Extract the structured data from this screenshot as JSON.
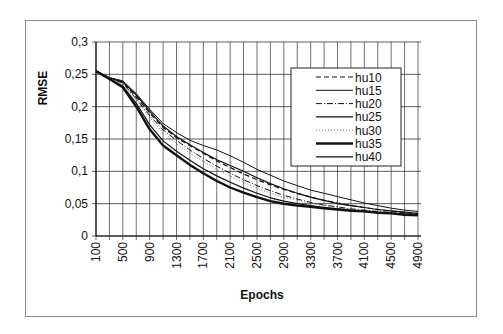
{
  "chart_data": {
    "type": "line",
    "title": "",
    "xlabel": "Epochs",
    "ylabel": "RMSE",
    "ylim": [
      0,
      0.3
    ],
    "xlim": [
      100,
      4900
    ],
    "grid": true,
    "legend_position": "upper right (inside plot)",
    "y_ticks": [
      "0",
      "0,05",
      "0,1",
      "0,15",
      "0,2",
      "0,25",
      "0,3"
    ],
    "x_ticks": [
      "100",
      "500",
      "900",
      "1300",
      "1700",
      "2100",
      "2500",
      "2900",
      "3300",
      "3700",
      "4100",
      "4500",
      "4900"
    ],
    "x": [
      100,
      300,
      500,
      700,
      900,
      1100,
      1300,
      1500,
      1700,
      1900,
      2100,
      2300,
      2500,
      2700,
      2900,
      3100,
      3300,
      3500,
      3700,
      3900,
      4100,
      4300,
      4500,
      4700,
      4900
    ],
    "series": [
      {
        "name": "hu10",
        "style": "dashed",
        "values": [
          0.255,
          0.245,
          0.238,
          0.215,
          0.19,
          0.168,
          0.152,
          0.14,
          0.128,
          0.116,
          0.106,
          0.096,
          0.087,
          0.079,
          0.072,
          0.066,
          0.06,
          0.055,
          0.051,
          0.047,
          0.044,
          0.041,
          0.038,
          0.036,
          0.035
        ]
      },
      {
        "name": "hu15",
        "style": "solid-thin",
        "values": [
          0.255,
          0.245,
          0.24,
          0.22,
          0.196,
          0.174,
          0.16,
          0.148,
          0.14,
          0.133,
          0.124,
          0.114,
          0.103,
          0.094,
          0.085,
          0.078,
          0.071,
          0.066,
          0.061,
          0.056,
          0.051,
          0.047,
          0.043,
          0.04,
          0.038
        ]
      },
      {
        "name": "hu20",
        "style": "dash-dot",
        "values": [
          0.255,
          0.245,
          0.236,
          0.212,
          0.186,
          0.164,
          0.148,
          0.133,
          0.12,
          0.108,
          0.097,
          0.087,
          0.078,
          0.07,
          0.063,
          0.057,
          0.052,
          0.048,
          0.045,
          0.042,
          0.04,
          0.038,
          0.036,
          0.034,
          0.033
        ]
      },
      {
        "name": "hu25",
        "style": "solid",
        "values": [
          0.255,
          0.244,
          0.238,
          0.218,
          0.193,
          0.17,
          0.154,
          0.141,
          0.129,
          0.118,
          0.109,
          0.1,
          0.09,
          0.081,
          0.073,
          0.066,
          0.06,
          0.055,
          0.05,
          0.047,
          0.044,
          0.041,
          0.039,
          0.037,
          0.035
        ]
      },
      {
        "name": "hu30",
        "style": "dotted",
        "values": [
          0.255,
          0.245,
          0.235,
          0.21,
          0.183,
          0.16,
          0.143,
          0.128,
          0.115,
          0.103,
          0.093,
          0.083,
          0.074,
          0.066,
          0.06,
          0.055,
          0.05,
          0.047,
          0.044,
          0.041,
          0.039,
          0.037,
          0.035,
          0.033,
          0.032
        ]
      },
      {
        "name": "hu35",
        "style": "solid-thick",
        "values": [
          0.255,
          0.243,
          0.23,
          0.2,
          0.165,
          0.14,
          0.125,
          0.11,
          0.097,
          0.085,
          0.075,
          0.067,
          0.06,
          0.054,
          0.05,
          0.047,
          0.045,
          0.043,
          0.041,
          0.039,
          0.038,
          0.036,
          0.035,
          0.033,
          0.032
        ]
      },
      {
        "name": "hu40",
        "style": "solid",
        "values": [
          0.255,
          0.243,
          0.232,
          0.205,
          0.172,
          0.147,
          0.131,
          0.117,
          0.104,
          0.093,
          0.083,
          0.074,
          0.066,
          0.059,
          0.054,
          0.05,
          0.047,
          0.044,
          0.042,
          0.04,
          0.038,
          0.036,
          0.035,
          0.034,
          0.033
        ]
      }
    ]
  }
}
